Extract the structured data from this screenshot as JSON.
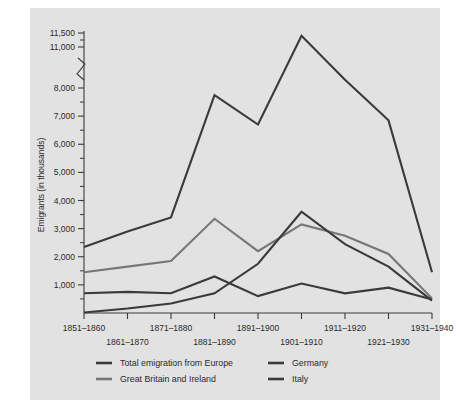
{
  "panel": {
    "background_color": "#e2e2e2",
    "page_background": "#ffffff"
  },
  "axis": {
    "y_title": "Emigrants (in thousands)",
    "y_tick_labels": [
      "1,000",
      "2,000",
      "3,000",
      "4,000",
      "5,000",
      "6,000",
      "7,000",
      "8,000",
      "11,000",
      "11,500"
    ],
    "y_break_note": "axis break between 8,000 and 11,000",
    "x_tick_labels": [
      "1851–1860",
      "1861–1870",
      "1871–1880",
      "1881–1890",
      "1891–1900",
      "1901–1910",
      "1911–1920",
      "1921–1930",
      "1931–1940"
    ]
  },
  "legend": {
    "position": "bottom",
    "entries": [
      {
        "label": "Total emigration from Europe",
        "color": "#3a3a3a"
      },
      {
        "label": "Great Britain and Ireland",
        "color": "#777777"
      },
      {
        "label": "Germany",
        "color": "#3a3a3a"
      },
      {
        "label": "Italy",
        "color": "#3a3a3a"
      }
    ]
  },
  "chart_data": {
    "type": "line",
    "title": "",
    "xlabel": "",
    "ylabel": "Emigrants (in thousands)",
    "ylim": [
      0,
      11500
    ],
    "y_axis_break": [
      8000,
      11000
    ],
    "grid": false,
    "legend_position": "bottom",
    "categories": [
      "1851–1860",
      "1861–1870",
      "1871–1880",
      "1881–1890",
      "1891–1900",
      "1901–1910",
      "1911–1920",
      "1921–1930",
      "1931–1940"
    ],
    "series": [
      {
        "name": "Total emigration from Europe",
        "color": "#3a3a3a",
        "values": [
          2350,
          2900,
          3400,
          7750,
          6700,
          11400,
          8600,
          6850,
          1450
        ]
      },
      {
        "name": "Great Britain and Ireland",
        "color": "#777777",
        "values": [
          1450,
          1650,
          1850,
          3350,
          2200,
          3150,
          2750,
          2100,
          520
        ]
      },
      {
        "name": "Germany",
        "color": "#3a3a3a",
        "values": [
          700,
          750,
          700,
          1300,
          600,
          1050,
          700,
          900,
          480
        ]
      },
      {
        "name": "Italy",
        "color": "#3a3a3a",
        "values": [
          20,
          160,
          340,
          700,
          1750,
          3600,
          2450,
          1650,
          440
        ]
      }
    ]
  }
}
